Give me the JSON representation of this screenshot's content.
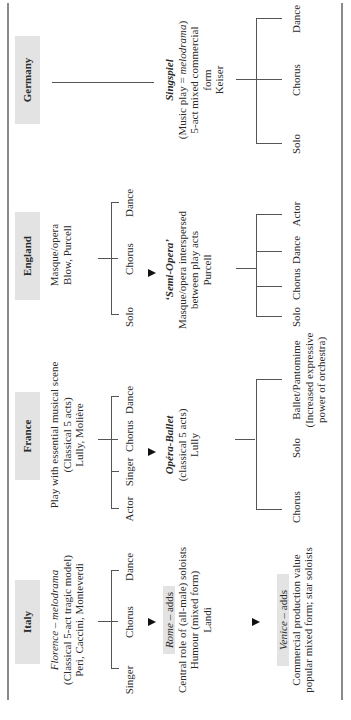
{
  "columns": {
    "italy": {
      "header": "Italy",
      "intro": {
        "line1_italic": "Florence",
        "line1_rest": " – ",
        "line1_italic2": "melodrama",
        "line2": "(Classical 5-act tragic model)",
        "line3": "Peri, Caccini, Monteverdi"
      },
      "branches": [
        "Singer",
        "Chorus",
        "Dance"
      ],
      "rome": {
        "label_italic": "Rome",
        "label_rest": " – adds",
        "line1": "Central role of (all-male) soloists",
        "line2": "Humour (mixed form)",
        "line3": "Landi"
      },
      "venice": {
        "label_italic": "Venice",
        "label_rest": " – adds",
        "line1": "Commercial production value",
        "line2": "popular mixed form; star soloists"
      }
    },
    "france": {
      "header": "France",
      "intro": {
        "line1": "Play with essential musical scene",
        "line2": "(Classical 5 acts)",
        "line3": "Lully, Molière"
      },
      "branches": [
        "Actor",
        "Singer",
        "Chorus",
        "Dance"
      ],
      "result": {
        "title": "Opéra-Ballet",
        "line1": "(classical 5 acts)",
        "line2": "Lully"
      },
      "branches2": [
        "Chorus",
        "Solo",
        "Ballet/Pantomime"
      ],
      "ballet_note": {
        "line1": "(Increased expressive",
        "line2": "power of orchestra)"
      }
    },
    "england": {
      "header": "England",
      "intro": {
        "line1": "Masque/opera",
        "line2": "Blow, Purcell"
      },
      "branches": [
        "Solo",
        "Chorus",
        "Dance"
      ],
      "result": {
        "title": "‘Semi-Opera’",
        "line1": "Masque/opera interspersed",
        "line2": "between play acts",
        "line3": "Purcell"
      },
      "branches2": [
        "Solo",
        "Chorus",
        "Dance",
        "Actor"
      ]
    },
    "germany": {
      "header": "Germany",
      "result": {
        "title": "Singspiel",
        "line1_pre": "(Music play  =  ",
        "line1_italic": "melodrama",
        "line1_post": ")",
        "line2": "5-act mixed commercial",
        "line3": "form",
        "line4": "Keiser"
      },
      "branches2": [
        "Solo",
        "Chorus",
        "Dance"
      ]
    }
  },
  "colors": {
    "header_bg": "#e3e3e3",
    "rule": "#8a8a8a",
    "line": "#555555",
    "text": "#2a2a2a"
  }
}
